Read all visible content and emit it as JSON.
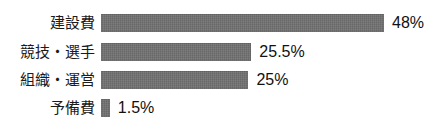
{
  "chart_data": {
    "type": "bar",
    "orientation": "horizontal",
    "title": "",
    "subtitle": "",
    "xlabel": "",
    "ylabel": "",
    "grid": false,
    "legend": false,
    "xlim": [
      0,
      48
    ],
    "unit": "%",
    "categories": [
      "建設費",
      "競技・選手",
      "組織・運営",
      "予備費"
    ],
    "values": [
      48,
      25.5,
      25,
      1.5
    ],
    "value_labels": [
      "48%",
      "25.5%",
      "25%",
      "1.5%"
    ],
    "colors": {
      "bar": "#6e6e6e",
      "text": "#111111",
      "label": "#1a1a1a",
      "background": "#ffffff"
    }
  },
  "rows": [
    {
      "label": "建設費",
      "value_label": "48%",
      "value": 48
    },
    {
      "label": "競技・選手",
      "value_label": "25.5%",
      "value": 25.5
    },
    {
      "label": "組織・運営",
      "value_label": "25%",
      "value": 25
    },
    {
      "label": "予備費",
      "value_label": "1.5%",
      "value": 1.5
    }
  ]
}
